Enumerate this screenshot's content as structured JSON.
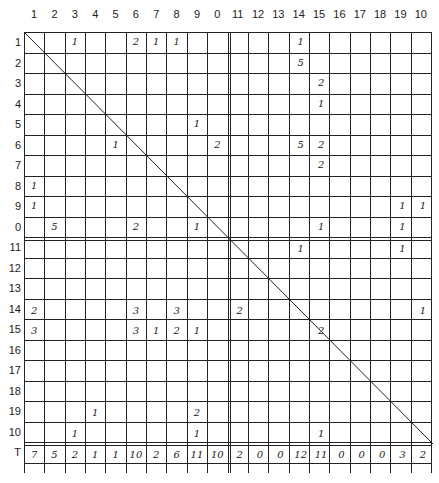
{
  "col_labels": [
    "1",
    "2",
    "3",
    "4",
    "5",
    "6",
    "7",
    "8",
    "9",
    "0",
    "11",
    "12",
    "13",
    "14",
    "15",
    "16",
    "17",
    "18",
    "19",
    "10"
  ],
  "row_labels": [
    "1",
    "2",
    "3",
    "4",
    "5",
    "6",
    "7",
    "8",
    "9",
    "0",
    "11",
    "12",
    "13",
    "14",
    "15",
    "16",
    "17",
    "18",
    "19",
    "10",
    "T"
  ],
  "cells": [
    {
      "r": 1,
      "c": 3,
      "v": "1"
    },
    {
      "r": 1,
      "c": 6,
      "v": "2"
    },
    {
      "r": 1,
      "c": 7,
      "v": "1"
    },
    {
      "r": 1,
      "c": 8,
      "v": "1"
    },
    {
      "r": 1,
      "c": 14,
      "v": "1"
    },
    {
      "r": 2,
      "c": 14,
      "v": "5"
    },
    {
      "r": 3,
      "c": 15,
      "v": "2"
    },
    {
      "r": 4,
      "c": 15,
      "v": "1"
    },
    {
      "r": 5,
      "c": 9,
      "v": "1"
    },
    {
      "r": 6,
      "c": 5,
      "v": "1"
    },
    {
      "r": 6,
      "c": 10,
      "v": "2"
    },
    {
      "r": 6,
      "c": 14,
      "v": "5"
    },
    {
      "r": 6,
      "c": 15,
      "v": "2"
    },
    {
      "r": 7,
      "c": 15,
      "v": "2"
    },
    {
      "r": 8,
      "c": 1,
      "v": "1"
    },
    {
      "r": 9,
      "c": 1,
      "v": "1"
    },
    {
      "r": 9,
      "c": 19,
      "v": "1"
    },
    {
      "r": 9,
      "c": 20,
      "v": "1"
    },
    {
      "r": 10,
      "c": 2,
      "v": "5"
    },
    {
      "r": 10,
      "c": 6,
      "v": "2"
    },
    {
      "r": 10,
      "c": 9,
      "v": "1"
    },
    {
      "r": 10,
      "c": 15,
      "v": "1"
    },
    {
      "r": 10,
      "c": 19,
      "v": "1"
    },
    {
      "r": 11,
      "c": 14,
      "v": "1"
    },
    {
      "r": 11,
      "c": 19,
      "v": "1"
    },
    {
      "r": 14,
      "c": 1,
      "v": "2"
    },
    {
      "r": 14,
      "c": 6,
      "v": "3"
    },
    {
      "r": 14,
      "c": 8,
      "v": "3"
    },
    {
      "r": 14,
      "c": 11,
      "v": "2"
    },
    {
      "r": 14,
      "c": 20,
      "v": "1"
    },
    {
      "r": 15,
      "c": 1,
      "v": "3"
    },
    {
      "r": 15,
      "c": 6,
      "v": "3"
    },
    {
      "r": 15,
      "c": 7,
      "v": "1"
    },
    {
      "r": 15,
      "c": 8,
      "v": "2"
    },
    {
      "r": 15,
      "c": 9,
      "v": "1"
    },
    {
      "r": 15,
      "c": 15,
      "v": "2"
    },
    {
      "r": 19,
      "c": 4,
      "v": "1"
    },
    {
      "r": 19,
      "c": 9,
      "v": "2"
    },
    {
      "r": 20,
      "c": 3,
      "v": "1"
    },
    {
      "r": 20,
      "c": 9,
      "v": "1"
    },
    {
      "r": 20,
      "c": 15,
      "v": "1"
    }
  ],
  "totals": [
    "7",
    "5",
    "2",
    "1",
    "1",
    "10",
    "2",
    "6",
    "11",
    "10",
    "2",
    "0",
    "0",
    "12",
    "11",
    "0",
    "0",
    "0",
    "3",
    "2"
  ]
}
